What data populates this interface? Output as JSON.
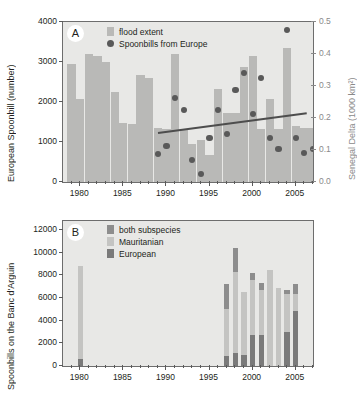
{
  "figure": {
    "panelA_letter": "A",
    "panelB_letter": "B"
  },
  "chart_data": [
    {
      "type": "bar",
      "panel": "A",
      "title": "",
      "xlabel": "",
      "ylabel": "European Spoonbill (number)",
      "ylabel_right": "Senegal Delta (1000 km²)",
      "xlim": [
        1978.5,
        2007.5
      ],
      "ylim": [
        0,
        4000
      ],
      "ylim_right": [
        0.0,
        0.5
      ],
      "yticks": [
        0,
        1000,
        2000,
        3000,
        4000
      ],
      "yticklabels": [
        "0",
        "1000",
        "2000",
        "3000",
        "4000"
      ],
      "yticks_right": [
        0.0,
        0.1,
        0.2,
        0.3,
        0.4,
        0.5
      ],
      "yticklabels_right": [
        "0.0",
        "0.1",
        "0.2",
        "0.3",
        "0.4",
        "0.5"
      ],
      "xticks": [
        1980,
        1985,
        1990,
        1995,
        2000,
        2005
      ],
      "xticklabels": [
        "1980",
        "1985",
        "1990",
        "1995",
        "2000",
        "2005"
      ],
      "grid": false,
      "legend_position": "top-left",
      "legend": [
        {
          "label": "flood extent",
          "marker": "bar",
          "color": "#b9b9b7"
        },
        {
          "label": "Spoonbills from Europe",
          "marker": "circle",
          "color": "#595959"
        }
      ],
      "series": [
        {
          "name": "flood extent",
          "axis": "right",
          "unit": "1000 km2",
          "color": "#b9b9b7",
          "x": [
            1979,
            1980,
            1981,
            1982,
            1983,
            1984,
            1985,
            1986,
            1987,
            1988,
            1989,
            1990,
            1991,
            1992,
            1993,
            1994,
            1995,
            1996,
            1997,
            1998,
            1999,
            2000,
            2001,
            2002,
            2003,
            2004,
            2005,
            2006,
            2007
          ],
          "values": [
            0.37,
            0.26,
            0.4,
            0.395,
            0.375,
            0.28,
            0.185,
            0.18,
            0.335,
            0.325,
            0.17,
            0.165,
            0.4,
            0.165,
            0.12,
            0.13,
            0.085,
            0.29,
            0.215,
            0.215,
            0.36,
            0.395,
            0.165,
            0.26,
            0.165,
            0.42,
            0.175,
            0.17,
            0.17
          ]
        },
        {
          "name": "Spoonbills from Europe",
          "axis": "left",
          "unit": "number",
          "color": "#595959",
          "x": [
            1989,
            1990,
            1991,
            1992,
            1993,
            1994,
            1995,
            1996,
            1997,
            1998,
            1999,
            2000,
            2001,
            2002,
            2003,
            2004,
            2005,
            2006,
            2007
          ],
          "values": [
            700,
            900,
            2100,
            1800,
            550,
            200,
            1090,
            1800,
            1200,
            2300,
            2720,
            1710,
            2610,
            1100,
            820,
            3800,
            1090,
            720,
            820
          ]
        },
        {
          "name": "trend line",
          "axis": "left",
          "color": "#4d4d4d",
          "x": [
            1989,
            2006.2
          ],
          "values": [
            1240,
            1730
          ]
        }
      ]
    },
    {
      "type": "bar",
      "panel": "B",
      "title": "",
      "xlabel": "",
      "ylabel": "Spoonbills on the Banc d'Arguin",
      "xlim": [
        1978.5,
        2007.5
      ],
      "ylim": [
        0,
        12800
      ],
      "yticks": [
        0,
        2000,
        4000,
        6000,
        8000,
        10000,
        12000
      ],
      "yticklabels": [
        "0",
        "2000",
        "4000",
        "6000",
        "8000",
        "10000",
        "12000"
      ],
      "xticks": [
        1980,
        1985,
        1990,
        1995,
        2000,
        2005
      ],
      "xticklabels": [
        "1980",
        "1985",
        "1990",
        "1995",
        "2000",
        "2005"
      ],
      "grid": false,
      "stacked": true,
      "legend_position": "top-left",
      "legend": [
        {
          "label": "both subspecies",
          "marker": "bar",
          "color": "#8d8d8d"
        },
        {
          "label": "Mauritanian",
          "marker": "bar",
          "color": "#c4c4c2"
        },
        {
          "label": "European",
          "marker": "bar",
          "color": "#7a7a7a"
        }
      ],
      "categories": [
        1980,
        1997,
        1998,
        1999,
        2000,
        2001,
        2002,
        2003,
        2004,
        2005
      ],
      "series": [
        {
          "name": "European",
          "color": "#7a7a7a",
          "values": [
            620,
            880,
            1120,
            980,
            2740,
            2740,
            0,
            0,
            3040,
            4900
          ]
        },
        {
          "name": "Mauritanian",
          "color": "#c4c4c2",
          "values": [
            8180,
            4120,
            7180,
            5520,
            4860,
            4000,
            8500,
            6880,
            3280,
            1450
          ]
        },
        {
          "name": "both subspecies",
          "color": "#8d8d8d",
          "values": [
            0,
            2200,
            2100,
            0,
            620,
            560,
            0,
            0,
            420,
            850
          ]
        }
      ]
    }
  ]
}
